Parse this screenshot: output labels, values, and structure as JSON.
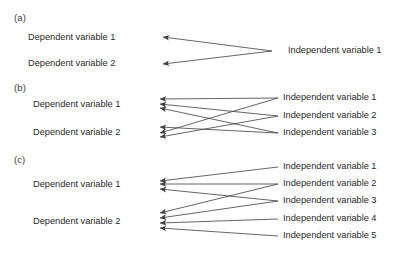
{
  "figure": {
    "title_visible": false,
    "line_color": "#3f3f3f",
    "text_color": "#2b2b2b",
    "background": "#ffffff"
  },
  "panels": [
    {
      "id": "a",
      "label": "(a)",
      "label_pos": {
        "x": 14,
        "y": 18
      },
      "dependent_variables": [
        {
          "label": "Dependent variable 1",
          "x": 28,
          "y": 38
        },
        {
          "label": "Dependent variable 2",
          "x": 28,
          "y": 64
        }
      ],
      "independent_variables": [
        {
          "label": "Independent variable 1",
          "x": 288,
          "y": 51
        }
      ],
      "arrows": [
        {
          "from": "Independent variable 1",
          "to": "Dependent variable 1",
          "x1": 272,
          "y1": 51,
          "x2": 163,
          "y2": 37
        },
        {
          "from": "Independent variable 1",
          "to": "Dependent variable 2",
          "x1": 272,
          "y1": 51,
          "x2": 163,
          "y2": 64
        }
      ]
    },
    {
      "id": "b",
      "label": "(b)",
      "label_pos": {
        "x": 14,
        "y": 88
      },
      "dependent_variables": [
        {
          "label": "Dependent variable 1",
          "x": 33,
          "y": 105
        },
        {
          "label": "Dependent variable 2",
          "x": 33,
          "y": 133
        }
      ],
      "independent_variables": [
        {
          "label": "Independent variable 1",
          "x": 283,
          "y": 98
        },
        {
          "label": "Independent variable 2",
          "x": 283,
          "y": 116
        },
        {
          "label": "Independent variable 3",
          "x": 283,
          "y": 133
        }
      ],
      "arrows": [
        {
          "from": "Independent variable 1",
          "to": "Dependent variable 1",
          "x1": 278,
          "y1": 98,
          "x2": 160,
          "y2": 99
        },
        {
          "from": "Independent variable 2",
          "to": "Dependent variable 1",
          "x1": 278,
          "y1": 116,
          "x2": 160,
          "y2": 104
        },
        {
          "from": "Independent variable 3",
          "to": "Dependent variable 1",
          "x1": 278,
          "y1": 133,
          "x2": 160,
          "y2": 108
        },
        {
          "from": "Independent variable 1",
          "to": "Dependent variable 2",
          "x1": 278,
          "y1": 98,
          "x2": 160,
          "y2": 133
        },
        {
          "from": "Independent variable 2",
          "to": "Dependent variable 2",
          "x1": 278,
          "y1": 116,
          "x2": 160,
          "y2": 137
        },
        {
          "from": "Independent variable 3",
          "to": "Dependent variable 2",
          "x1": 278,
          "y1": 133,
          "x2": 160,
          "y2": 127
        }
      ]
    },
    {
      "id": "c",
      "label": "(c)",
      "label_pos": {
        "x": 14,
        "y": 160
      },
      "dependent_variables": [
        {
          "label": "Dependent variable 1",
          "x": 33,
          "y": 185
        },
        {
          "label": "Dependent variable 2",
          "x": 33,
          "y": 222
        }
      ],
      "independent_variables": [
        {
          "label": "Independent variable 1",
          "x": 283,
          "y": 167
        },
        {
          "label": "Independent variable 2",
          "x": 283,
          "y": 184
        },
        {
          "label": "Independent variable 3",
          "x": 283,
          "y": 201
        },
        {
          "label": "Independent variable 4",
          "x": 283,
          "y": 219
        },
        {
          "label": "Independent variable 5",
          "x": 283,
          "y": 236
        }
      ],
      "arrows": [
        {
          "from": "Independent variable 1",
          "to": "Dependent variable 1",
          "x1": 278,
          "y1": 167,
          "x2": 160,
          "y2": 181
        },
        {
          "from": "Independent variable 2",
          "to": "Dependent variable 1",
          "x1": 278,
          "y1": 184,
          "x2": 160,
          "y2": 184
        },
        {
          "from": "Independent variable 3",
          "to": "Dependent variable 1",
          "x1": 278,
          "y1": 201,
          "x2": 160,
          "y2": 189
        },
        {
          "from": "Independent variable 2",
          "to": "Dependent variable 2",
          "x1": 278,
          "y1": 184,
          "x2": 160,
          "y2": 213
        },
        {
          "from": "Independent variable 3",
          "to": "Dependent variable 2",
          "x1": 278,
          "y1": 201,
          "x2": 160,
          "y2": 218
        },
        {
          "from": "Independent variable 4",
          "to": "Dependent variable 2",
          "x1": 278,
          "y1": 219,
          "x2": 160,
          "y2": 223
        },
        {
          "from": "Independent variable 5",
          "to": "Dependent variable 2",
          "x1": 278,
          "y1": 236,
          "x2": 160,
          "y2": 228
        }
      ]
    }
  ]
}
